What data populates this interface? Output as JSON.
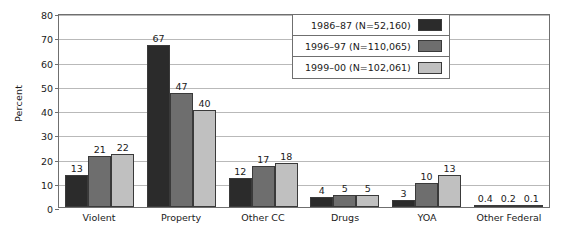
{
  "chart_data": {
    "type": "bar",
    "title": "",
    "xlabel": "",
    "ylabel": "Percent",
    "ylim": [
      0,
      80
    ],
    "yticks": [
      0,
      10,
      20,
      30,
      40,
      50,
      60,
      70,
      80
    ],
    "grid": true,
    "legend_position": "top-right",
    "categories": [
      "Violent",
      "Property",
      "Other CC",
      "Drugs",
      "YOA",
      "Other Federal"
    ],
    "series": [
      {
        "name": "1986–87 (N=52,160)",
        "color": "#2b2b2b",
        "values": [
          13,
          67,
          12,
          4,
          3,
          0.4
        ],
        "labels": [
          "13",
          "67",
          "12",
          "4",
          "3",
          "0.4"
        ]
      },
      {
        "name": "1996–97 (N=110,065)",
        "color": "#6e6e6e",
        "values": [
          21,
          47,
          17,
          5,
          10,
          0.2
        ],
        "labels": [
          "21",
          "47",
          "17",
          "5",
          "10",
          "0.2"
        ]
      },
      {
        "name": "1999–00 (N=102,061)",
        "color": "#c0c0c0",
        "values": [
          22,
          40,
          18,
          5,
          13,
          0.1
        ],
        "labels": [
          "22",
          "40",
          "18",
          "5",
          "13",
          "0.1"
        ]
      }
    ]
  }
}
